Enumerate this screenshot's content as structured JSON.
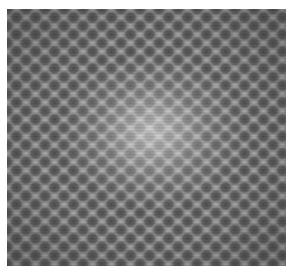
{
  "image": {
    "kind": "grayscale lattice micrograph",
    "description": "Atomic-resolution hexagonal lattice with bright central region",
    "colors": {
      "background": "#ffffff",
      "base_gray": "#8a8a8a",
      "dark_sites": "#3c3c3c",
      "bright_center": "#f0f0f0"
    }
  }
}
